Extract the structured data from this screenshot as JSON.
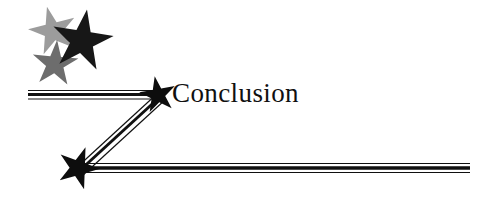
{
  "document": {
    "background_color": "#ffffff",
    "width": 498,
    "height": 207
  },
  "heading": {
    "text": "Conclusion",
    "color": "#101010"
  },
  "decoration": {
    "name": "star-banner-rule",
    "description": "Three-star cluster with a Z-shaped triple-rule leader ending in two solid stars",
    "stars": [
      {
        "name": "star-light-gray",
        "fill": "#9a9a9a",
        "cx": 54,
        "cy": 32,
        "radius": 26,
        "rotation": -14
      },
      {
        "name": "star-black-large",
        "fill": "#161616",
        "cx": 81,
        "cy": 41,
        "radius": 32,
        "rotation": 8
      },
      {
        "name": "star-mid-gray",
        "fill": "#6a6a6a",
        "cx": 54,
        "cy": 63,
        "radius": 25,
        "rotation": 4
      },
      {
        "name": "star-arrow-tip-upper",
        "fill": "#0d0d0d",
        "cx": 158,
        "cy": 95,
        "radius": 20,
        "rotation": -8
      },
      {
        "name": "star-arrow-tip-lower",
        "fill": "#0d0d0d",
        "cx": 78,
        "cy": 168,
        "radius": 22,
        "rotation": 18
      }
    ],
    "rules": {
      "stroke_color": "#111111",
      "thin_width": 1,
      "thick_width": 3,
      "top_rule": {
        "x1": 28,
        "y1": 95,
        "x2": 158,
        "y2": 95
      },
      "diagonal_rule": {
        "x1": 158,
        "y1": 95,
        "x2": 80,
        "y2": 168
      },
      "bottom_rule": {
        "x1": 80,
        "y1": 168,
        "x2": 470,
        "y2": 168
      }
    }
  }
}
